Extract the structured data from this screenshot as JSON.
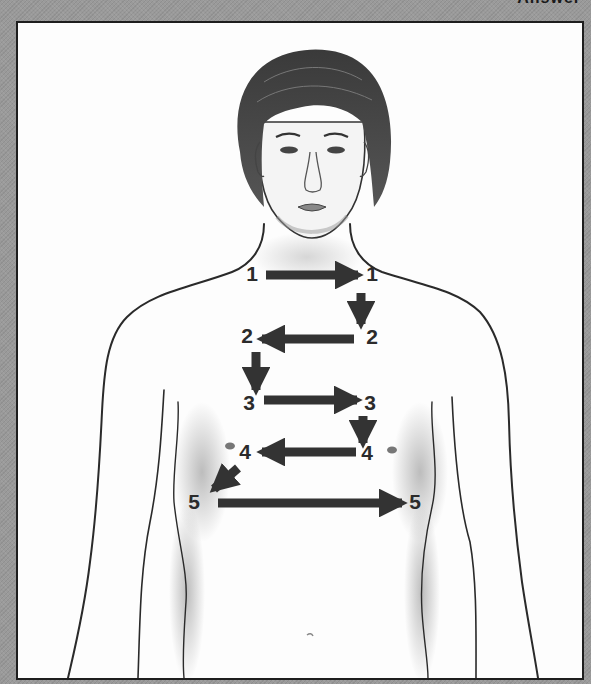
{
  "header": {
    "cut_off_text": "Answer"
  },
  "figure": {
    "colors": {
      "background": "#9a9a9a",
      "panel": "#fdfdfd",
      "frame_border": "#1e1e1e",
      "arrow": "#333333",
      "label": "#2b2b2b",
      "outline": "#2a2a2a"
    },
    "steps": [
      {
        "number": "1",
        "start_label": "1",
        "end_label": "1",
        "direction": "right"
      },
      {
        "number": "2",
        "start_label": "2",
        "end_label": "2",
        "direction": "left"
      },
      {
        "number": "3",
        "start_label": "3",
        "end_label": "3",
        "direction": "right"
      },
      {
        "number": "4",
        "start_label": "4",
        "end_label": "4",
        "direction": "left"
      },
      {
        "number": "5",
        "start_label": "5",
        "end_label": "5",
        "direction": "right"
      }
    ],
    "connectors": [
      {
        "from": "1",
        "to": "2",
        "direction": "down"
      },
      {
        "from": "2",
        "to": "3",
        "direction": "down"
      },
      {
        "from": "3",
        "to": "4",
        "direction": "down"
      },
      {
        "from": "4",
        "to": "5",
        "direction": "down-left"
      }
    ]
  }
}
